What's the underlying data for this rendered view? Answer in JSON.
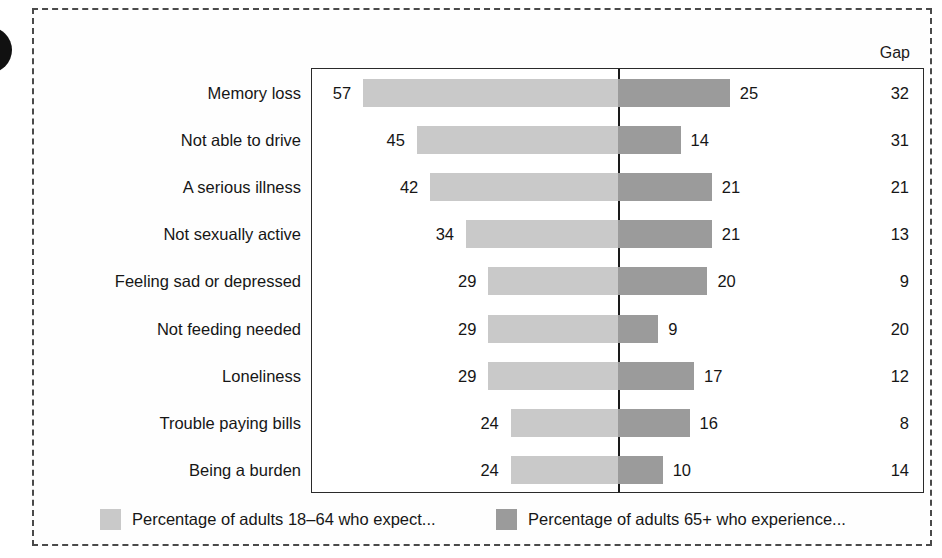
{
  "chart_data": {
    "type": "bar",
    "title": "",
    "subtitle": "",
    "xlabel": "",
    "ylabel": "",
    "orientation": "horizontal-diverging",
    "grid": false,
    "legend_position": "bottom",
    "gap_column_header": "Gap",
    "categories": [
      "Memory loss",
      "Not able to drive",
      "A serious illness",
      "Not sexually active",
      "Feeling sad or depressed",
      "Not feeding needed",
      "Loneliness",
      "Trouble paying bills",
      "Being a burden"
    ],
    "series": [
      {
        "name": "Percentage of adults 18–64 who expect...",
        "color": "#c9c9c9",
        "side": "left",
        "values": [
          57,
          45,
          42,
          34,
          29,
          29,
          29,
          24,
          24
        ]
      },
      {
        "name": "Percentage of adults 65+ who experience...",
        "color": "#9b9b9b",
        "side": "right",
        "values": [
          25,
          14,
          21,
          21,
          20,
          9,
          17,
          16,
          10
        ]
      }
    ],
    "gap_values": [
      32,
      31,
      21,
      13,
      9,
      20,
      12,
      8,
      14
    ],
    "xlim_left": [
      0,
      60
    ],
    "xlim_right": [
      0,
      60
    ],
    "units": "percent"
  },
  "rows": [
    {
      "label": "Memory loss",
      "left": 57,
      "right": 25,
      "gap": 32
    },
    {
      "label": "Not able to drive",
      "left": 45,
      "right": 14,
      "gap": 31
    },
    {
      "label": "A serious illness",
      "left": 42,
      "right": 21,
      "gap": 21
    },
    {
      "label": "Not sexually active",
      "left": 34,
      "right": 21,
      "gap": 13
    },
    {
      "label": "Feeling sad or depressed",
      "left": 29,
      "right": 20,
      "gap": 9
    },
    {
      "label": "Not feeding needed",
      "left": 29,
      "right": 9,
      "gap": 20
    },
    {
      "label": "Loneliness",
      "left": 29,
      "right": 17,
      "gap": 12
    },
    {
      "label": "Trouble paying bills",
      "left": 24,
      "right": 16,
      "gap": 8
    },
    {
      "label": "Being a burden",
      "left": 24,
      "right": 10,
      "gap": 14
    }
  ],
  "header": {
    "gap_label": "Gap"
  },
  "legend": [
    {
      "label": "Percentage of adults 18–64 who expect...",
      "color": "#c9c9c9"
    },
    {
      "label": "Percentage of adults 65+ who experience...",
      "color": "#9b9b9b"
    }
  ],
  "colors": {
    "series_left": "#c9c9c9",
    "series_right": "#9b9b9b",
    "axis": "#1a1a1a",
    "frame": "#4a4a4a",
    "text": "#161616"
  }
}
